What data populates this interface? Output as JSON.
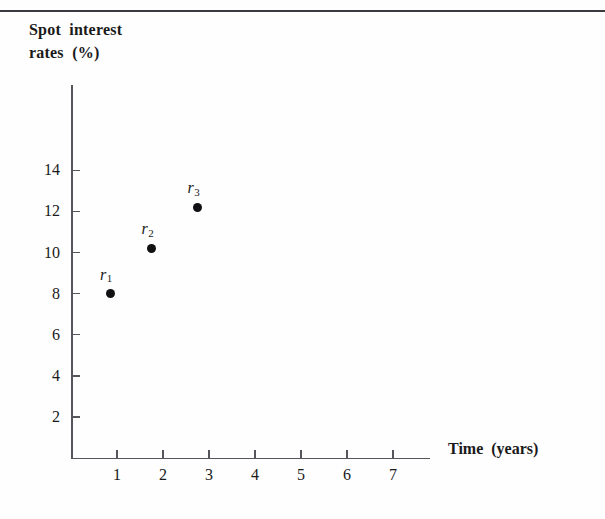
{
  "chart_data": {
    "type": "scatter",
    "title": "Spot  interest\nrates  (%)",
    "title_lines": [
      "Spot  interest",
      "rates  (%)"
    ],
    "xlabel": "Time  (years)",
    "ylabel": "Spot interest rates (%)",
    "xlim": [
      0,
      7.8
    ],
    "ylim": [
      0,
      16.2
    ],
    "grid": false,
    "legend": false,
    "x_ticks": [
      1,
      2,
      3,
      4,
      5,
      6,
      7
    ],
    "x_tick_labels": [
      "1",
      "2",
      "3",
      "4",
      "5",
      "6",
      "7"
    ],
    "y_ticks": [
      2,
      4,
      6,
      8,
      10,
      12,
      14
    ],
    "y_tick_labels": [
      "2",
      "4",
      "6",
      "8",
      "10",
      "12",
      "14"
    ],
    "points": [
      {
        "label": "r",
        "subscript": "1",
        "x": 0.85,
        "y": 8.0
      },
      {
        "label": "r",
        "subscript": "2",
        "x": 1.75,
        "y": 10.2
      },
      {
        "label": "r",
        "subscript": "3",
        "x": 2.75,
        "y": 12.2
      }
    ],
    "colors": {
      "marker": "#111114",
      "axis": "#55555c",
      "text": "#1a1a1a",
      "rule": "#3a3a40",
      "background": "#fefefe"
    }
  }
}
